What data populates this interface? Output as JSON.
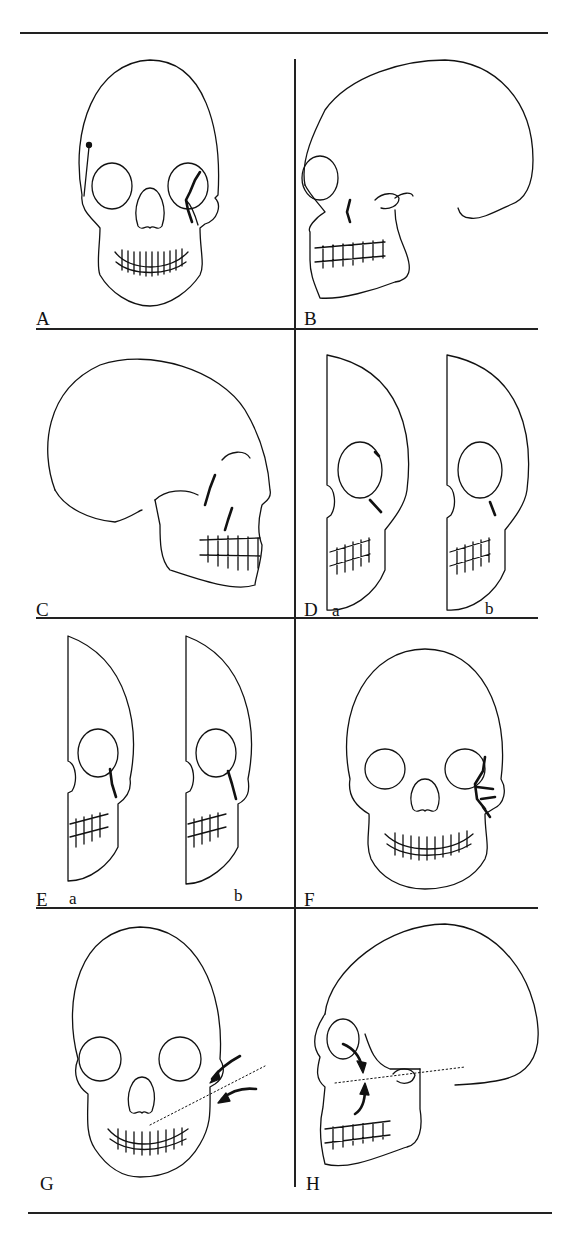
{
  "figure": {
    "panels": [
      {
        "id": "A",
        "label": "A",
        "view": "frontal skull",
        "fracture": "zygomaticomaxillary (left orbital rim / zygoma)"
      },
      {
        "id": "B",
        "label": "B",
        "view": "lateral skull",
        "fracture": "zygomatic arch"
      },
      {
        "id": "C",
        "label": "C",
        "view": "oblique lateral skull",
        "fracture": "zygoma displacement"
      },
      {
        "id": "D",
        "label": "D",
        "view": "half-frontal skulls",
        "sublabels": [
          "a",
          "b"
        ],
        "fracture": "rotated zygoma"
      },
      {
        "id": "E",
        "label": "E",
        "view": "half-frontal skulls",
        "sublabels": [
          "a",
          "b"
        ],
        "fracture": "zygomatic body"
      },
      {
        "id": "F",
        "label": "F",
        "view": "frontal skull",
        "fracture": "comminuted zygoma"
      },
      {
        "id": "G",
        "label": "G",
        "view": "frontal skull",
        "annotation": "arrows with dotted rotation axis"
      },
      {
        "id": "H",
        "label": "H",
        "view": "lateral skull",
        "annotation": "curved arrows with dotted rotation axis"
      }
    ]
  }
}
